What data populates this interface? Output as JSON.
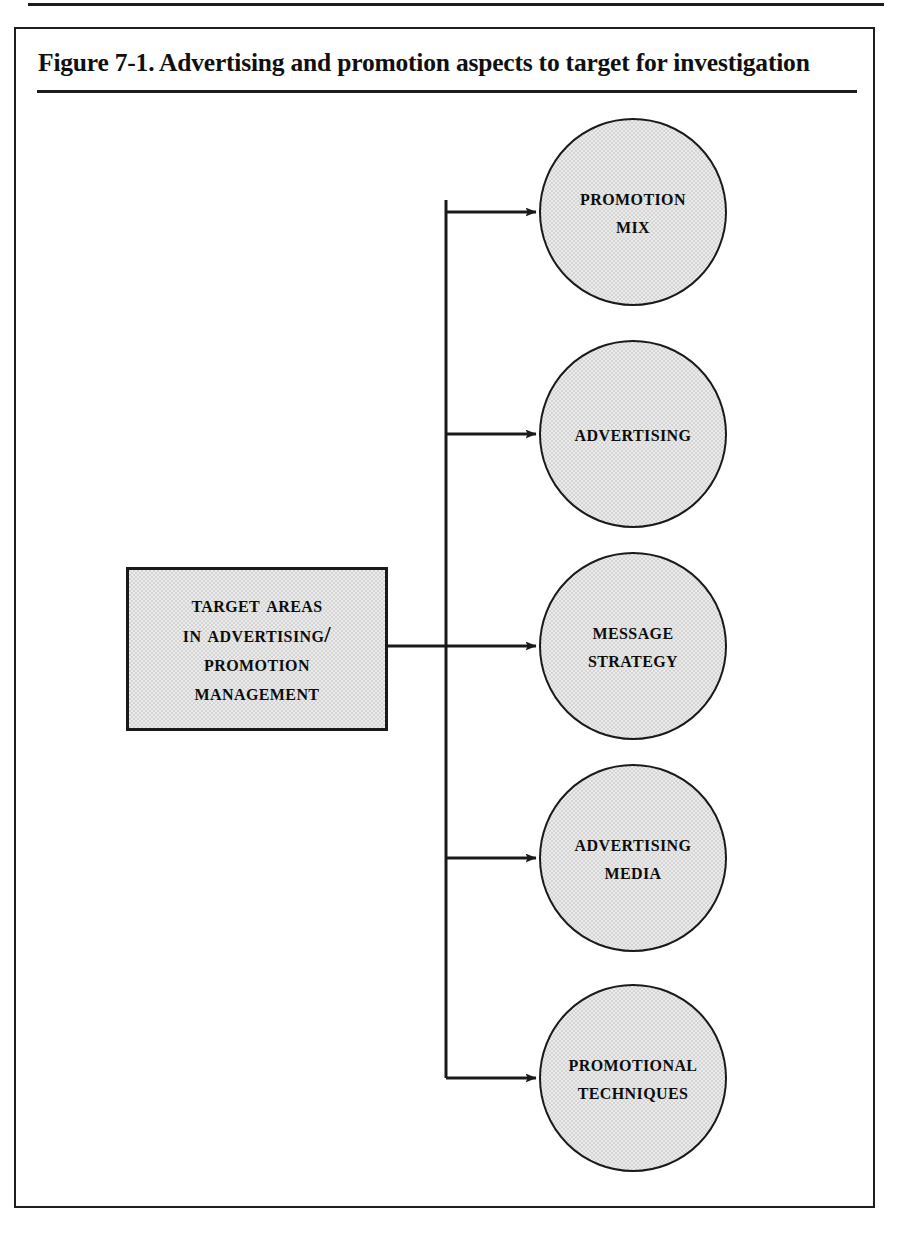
{
  "figure": {
    "title": "Figure 7-1.  Advertising and promotion aspects to target for investigation",
    "frame_color": "#1e1e1e",
    "node_fill": "#d4d4d4",
    "ink_color": "#1a1a1a"
  },
  "diagram": {
    "type": "radial-branching-flow",
    "root": {
      "id": "target-areas",
      "shape": "rectangle",
      "lines": [
        "Target Areas",
        "in Advertising/",
        "Promotion",
        "Management"
      ],
      "text": "Target Areas in Advertising/ Promotion Management"
    },
    "branches": [
      {
        "id": "promotion-mix",
        "shape": "circle",
        "lines": [
          "Promotion",
          "Mix"
        ],
        "text": "Promotion Mix"
      },
      {
        "id": "advertising",
        "shape": "circle",
        "lines": [
          "Advertising"
        ],
        "text": "Advertising"
      },
      {
        "id": "message-strategy",
        "shape": "circle",
        "lines": [
          "Message",
          "Strategy"
        ],
        "text": "Message Strategy"
      },
      {
        "id": "advertising-media",
        "shape": "circle",
        "lines": [
          "Advertising",
          "Media"
        ],
        "text": "Advertising Media"
      },
      {
        "id": "promotional-techniques",
        "shape": "circle",
        "lines": [
          "Promotional",
          "Techniques"
        ],
        "text": "Promotional Techniques"
      }
    ],
    "connector_style": "orthogonal-spine-with-arrowheads",
    "arrow_count": 5
  }
}
